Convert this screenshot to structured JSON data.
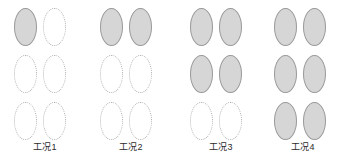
{
  "figure": {
    "type": "grouped-ellipse-state-diagram",
    "description_label": "工况对比示意图",
    "rows": 3,
    "columns": 2,
    "colors": {
      "filled_fill": "#d6d6d6",
      "filled_stroke": "#9a9a9a",
      "empty_stroke": "#b3b3b3",
      "background": "#ffffff",
      "caption_text": "#2b2b2b"
    },
    "legend": {
      "filled_meaning": "filled-ellipse",
      "empty_meaning": "dotted-outline-ellipse"
    },
    "groups": [
      {
        "id": "group-1",
        "caption": "工况1",
        "filled_count": 1,
        "total_count": 6,
        "left_px": 0,
        "width_px": 90,
        "cells": [
          {
            "row": 0,
            "col": 0,
            "state": "filled"
          },
          {
            "row": 0,
            "col": 1,
            "state": "empty"
          },
          {
            "row": 1,
            "col": 0,
            "state": "empty"
          },
          {
            "row": 1,
            "col": 1,
            "state": "empty"
          },
          {
            "row": 2,
            "col": 0,
            "state": "empty"
          },
          {
            "row": 2,
            "col": 1,
            "state": "empty"
          }
        ]
      },
      {
        "id": "group-2",
        "caption": "工况2",
        "filled_count": 2,
        "total_count": 6,
        "left_px": 86,
        "width_px": 90,
        "cells": [
          {
            "row": 0,
            "col": 0,
            "state": "filled"
          },
          {
            "row": 0,
            "col": 1,
            "state": "filled"
          },
          {
            "row": 1,
            "col": 0,
            "state": "empty"
          },
          {
            "row": 1,
            "col": 1,
            "state": "empty"
          },
          {
            "row": 2,
            "col": 0,
            "state": "empty"
          },
          {
            "row": 2,
            "col": 1,
            "state": "empty"
          }
        ]
      },
      {
        "id": "group-3",
        "caption": "工况3",
        "filled_count": 4,
        "total_count": 6,
        "left_px": 176,
        "width_px": 90,
        "cells": [
          {
            "row": 0,
            "col": 0,
            "state": "filled"
          },
          {
            "row": 0,
            "col": 1,
            "state": "filled"
          },
          {
            "row": 1,
            "col": 0,
            "state": "filled"
          },
          {
            "row": 1,
            "col": 1,
            "state": "filled"
          },
          {
            "row": 2,
            "col": 0,
            "state": "empty"
          },
          {
            "row": 2,
            "col": 1,
            "state": "empty"
          }
        ]
      },
      {
        "id": "group-4",
        "caption": "工况4",
        "filled_count": 6,
        "total_count": 6,
        "left_px": 260,
        "width_px": 86,
        "cells": [
          {
            "row": 0,
            "col": 0,
            "state": "filled"
          },
          {
            "row": 0,
            "col": 1,
            "state": "filled"
          },
          {
            "row": 1,
            "col": 0,
            "state": "filled"
          },
          {
            "row": 1,
            "col": 1,
            "state": "filled"
          },
          {
            "row": 2,
            "col": 0,
            "state": "filled"
          },
          {
            "row": 2,
            "col": 1,
            "state": "filled"
          }
        ]
      }
    ]
  }
}
